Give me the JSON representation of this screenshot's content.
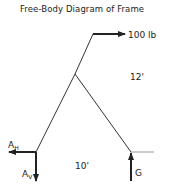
{
  "title": "Free-Body Diagram of Frame",
  "labels": {
    "force_top": "100 lb",
    "dim_right": "12'",
    "dim_bottom": "10'",
    "a_h": "A",
    "a_h_sub": "H",
    "a_v": "A",
    "a_v_sub": "V",
    "g": "G"
  },
  "colors": {
    "line": "#222222",
    "ground_line": "#999999",
    "background": "#ffffff"
  }
}
